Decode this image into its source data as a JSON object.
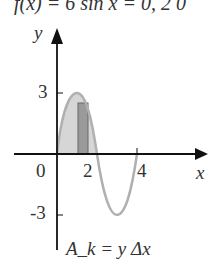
{
  "title": "f(x) = 6 sin x = 0, 2 0",
  "axes": {
    "y_label": "y",
    "x_label": "x",
    "y_ticks": [
      "3",
      "-3"
    ],
    "x_ticks": [
      "0",
      "2",
      "4"
    ]
  },
  "formula": "A_k = y Δx",
  "colors": {
    "curve": "#b0b0b0",
    "fill": "#d6d6d6",
    "rect": "#9a9a9a",
    "axis": "#111111"
  }
}
